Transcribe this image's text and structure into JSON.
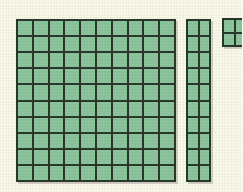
{
  "illustration": {
    "title": "Base Ten Blocks",
    "description": "Place value manipulatives showing a hundred flat, a ten rod, and a unit block",
    "background_color": "#fdfdee",
    "cell_fill_color": "#8fc9a0",
    "grid_line_color": "#2b3a2c",
    "cell_size_px": 16
  },
  "blocks": [
    {
      "name": "hundred-flat",
      "label": "Hundred flat",
      "columns": 10,
      "rows": 10,
      "cell_count": 100,
      "place_value": 100,
      "x": 16,
      "y": 19,
      "width": 160,
      "height": 163
    },
    {
      "name": "ten-rod",
      "label": "Ten rod",
      "columns": 2,
      "rows": 10,
      "cell_count": 20,
      "place_value": 20,
      "x": 186,
      "y": 19,
      "width": 25,
      "height": 163
    },
    {
      "name": "unit-block",
      "label": "Unit block",
      "columns": 2,
      "rows": 2,
      "cell_count": 4,
      "place_value": 4,
      "x": 222,
      "y": 18,
      "width": 25,
      "height": 29,
      "clipped": "right edge cut off by image boundary"
    }
  ],
  "totals": {
    "total_cells_visible": 124
  }
}
